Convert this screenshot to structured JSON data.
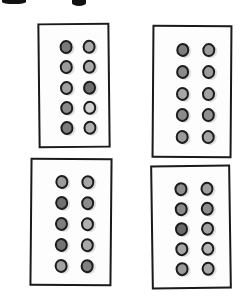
{
  "sketch": {
    "description": "hand-drawn four rectangles each containing a 2x5 grid of gray circles",
    "cropped_top_glyphs": [
      {
        "x": 2,
        "y": 0,
        "w": 24,
        "h": 4
      },
      {
        "x": 72,
        "y": 0,
        "w": 14,
        "h": 6
      }
    ],
    "trays": [
      {
        "id": "top-left",
        "x": 38,
        "y": 23,
        "w": 72,
        "h": 125,
        "rotate": -0.6,
        "wells": [
          [
            "#7a7a7a",
            "#a8a8a8"
          ],
          [
            "#9a9a9a",
            "#aaaaaa"
          ],
          [
            "#a0a0a0",
            "#6e6e6e"
          ],
          [
            "#8a8a8a",
            "#d0d0d0"
          ],
          [
            "#7c7c7c",
            "#b0b0b0"
          ]
        ]
      },
      {
        "id": "top-right",
        "x": 152,
        "y": 25,
        "w": 80,
        "h": 133,
        "rotate": 0.4,
        "wells": [
          [
            "#7e7e7e",
            "#9a9a9a"
          ],
          [
            "#8a8a8a",
            "#9c9c9c"
          ],
          [
            "#a6a6a6",
            "#a2a2a2"
          ],
          [
            "#8a8a8a",
            "#909090"
          ],
          [
            "#9a9a9a",
            "#a4a4a4"
          ]
        ]
      },
      {
        "id": "bottom-left",
        "x": 30,
        "y": 158,
        "w": 82,
        "h": 128,
        "rotate": 0.5,
        "wells": [
          [
            "#9c9c9c",
            "#a6a6a6"
          ],
          [
            "#707070",
            "#8c8c8c"
          ],
          [
            "#7e7e7e",
            "#b0b0b0"
          ],
          [
            "#747474",
            "#a8a8a8"
          ],
          [
            "#a2a2a2",
            "#808080"
          ]
        ]
      },
      {
        "id": "bottom-right",
        "x": 151,
        "y": 165,
        "w": 80,
        "h": 124,
        "rotate": -0.8,
        "wells": [
          [
            "#8e8e8e",
            "#9e9e9e"
          ],
          [
            "#8a8a8a",
            "#8c8c8c"
          ],
          [
            "#6a6a6a",
            "#a0a0a0"
          ],
          [
            "#a6a6a6",
            "#b4b4b4"
          ],
          [
            "#9a9a9a",
            "#a8a8a8"
          ]
        ]
      }
    ]
  }
}
